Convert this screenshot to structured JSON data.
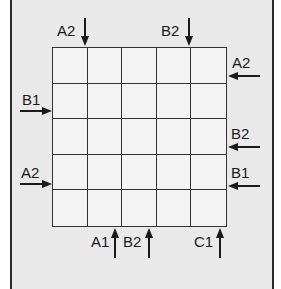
{
  "grid": {
    "rows": 5,
    "cols": 5
  },
  "clues": {
    "top": [
      {
        "label": "A2",
        "column": 1,
        "direction": "down"
      },
      {
        "label": "B2",
        "column": 4,
        "direction": "down"
      }
    ],
    "right": [
      {
        "label": "A2",
        "row": 1,
        "direction": "left"
      },
      {
        "label": "B2",
        "row": 3,
        "direction": "left"
      },
      {
        "label": "B1",
        "row": 4,
        "direction": "left"
      }
    ],
    "left": [
      {
        "label": "B1",
        "row": 2,
        "direction": "right"
      },
      {
        "label": "A2",
        "row": 4,
        "direction": "right"
      }
    ],
    "bottom": [
      {
        "label": "A1",
        "column": 2,
        "direction": "up"
      },
      {
        "label": "B2",
        "column": 3,
        "direction": "up"
      },
      {
        "label": "C1",
        "column": 5,
        "direction": "up"
      }
    ]
  },
  "colors": {
    "background": "#e9e9e9",
    "grid_line": "#333333",
    "cell": "#f3f3f3"
  }
}
